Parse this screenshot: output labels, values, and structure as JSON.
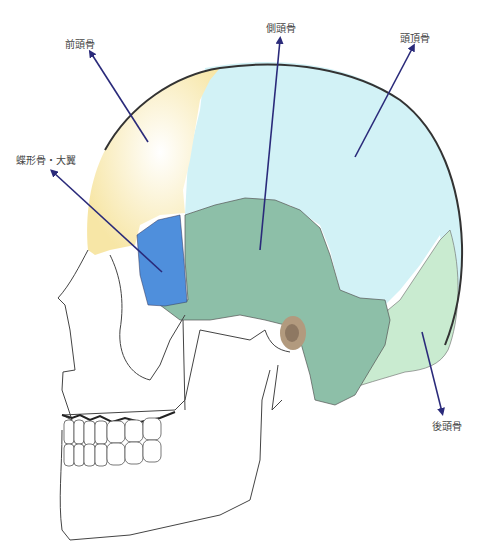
{
  "labels": {
    "frontal": "前頭骨",
    "temporal": "側頭骨",
    "parietal": "頭頂骨",
    "sphenoid": "蝶形骨・大翼",
    "occipital": "後頭骨"
  },
  "colors": {
    "frontal": "#fbeeb8",
    "parietal": "#d2f2f6",
    "temporal": "#8dbfa8",
    "sphenoid": "#4f8fdc",
    "occipital": "#c9ebd0",
    "arrow": "#2a2a7a",
    "outline": "#333333"
  }
}
